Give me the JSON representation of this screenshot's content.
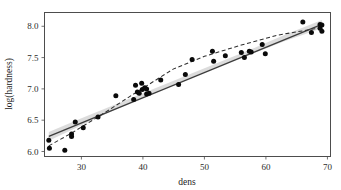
{
  "chart_data": {
    "type": "scatter",
    "title": "",
    "subtitle": "",
    "xlabel": "dens",
    "ylabel": "log(hardness)",
    "xlim": [
      24,
      70.5
    ],
    "ylim": [
      5.92,
      8.22
    ],
    "xticks": [
      30,
      40,
      50,
      60,
      70
    ],
    "xtick_labels": [
      "30",
      "40",
      "50",
      "60",
      "70"
    ],
    "yticks": [
      6.0,
      6.5,
      7.0,
      7.5,
      8.0
    ],
    "ytick_labels": [
      "6.0",
      "6.5",
      "7.0",
      "7.5",
      "8.0"
    ],
    "x_minor_ticks": [
      25,
      35,
      45,
      55,
      65
    ],
    "y_minor_ticks": [
      6.25,
      6.75,
      7.25,
      7.75
    ],
    "grid": true,
    "legend": "none",
    "point_color": "#0a0a0a",
    "line_color": "#3d3d3d",
    "band_color": "#bfbfbf",
    "panel_background": "#ffffff",
    "grid_color": "#d9d9d9",
    "points": [
      {
        "x": 24.7,
        "y": 6.18
      },
      {
        "x": 24.8,
        "y": 6.05
      },
      {
        "x": 27.3,
        "y": 6.02
      },
      {
        "x": 28.4,
        "y": 6.28
      },
      {
        "x": 28.4,
        "y": 6.24
      },
      {
        "x": 29.0,
        "y": 6.47
      },
      {
        "x": 30.3,
        "y": 6.38
      },
      {
        "x": 32.7,
        "y": 6.55
      },
      {
        "x": 35.6,
        "y": 6.89
      },
      {
        "x": 38.5,
        "y": 6.83
      },
      {
        "x": 38.8,
        "y": 7.06
      },
      {
        "x": 39.1,
        "y": 6.95
      },
      {
        "x": 39.4,
        "y": 6.93
      },
      {
        "x": 39.8,
        "y": 7.09
      },
      {
        "x": 39.9,
        "y": 6.99
      },
      {
        "x": 40.3,
        "y": 7.02
      },
      {
        "x": 40.6,
        "y": 7.0
      },
      {
        "x": 40.6,
        "y": 6.92
      },
      {
        "x": 41.0,
        "y": 6.93
      },
      {
        "x": 42.9,
        "y": 7.14
      },
      {
        "x": 45.8,
        "y": 7.07
      },
      {
        "x": 46.9,
        "y": 7.23
      },
      {
        "x": 48.0,
        "y": 7.47
      },
      {
        "x": 51.3,
        "y": 7.6
      },
      {
        "x": 51.5,
        "y": 7.44
      },
      {
        "x": 53.4,
        "y": 7.53
      },
      {
        "x": 56.0,
        "y": 7.58
      },
      {
        "x": 56.5,
        "y": 7.5
      },
      {
        "x": 57.3,
        "y": 7.6
      },
      {
        "x": 57.6,
        "y": 7.59
      },
      {
        "x": 59.4,
        "y": 7.71
      },
      {
        "x": 59.9,
        "y": 7.56
      },
      {
        "x": 66.0,
        "y": 8.07
      },
      {
        "x": 67.4,
        "y": 7.9
      },
      {
        "x": 68.8,
        "y": 7.97
      },
      {
        "x": 68.8,
        "y": 8.03
      },
      {
        "x": 69.1,
        "y": 8.02
      },
      {
        "x": 69.1,
        "y": 7.92
      }
    ],
    "series": [
      {
        "name": "linear-fit",
        "style": "solid",
        "x": [
          24.7,
          69.1
        ],
        "y": [
          6.24,
          8.03
        ]
      },
      {
        "name": "smoother-fit",
        "style": "dashed",
        "x": [
          24.7,
          28.5,
          33.0,
          39.0,
          45.0,
          50.0,
          56.0,
          62.0,
          69.1
        ],
        "y": [
          6.09,
          6.3,
          6.57,
          6.95,
          7.32,
          7.52,
          7.7,
          7.86,
          7.98
        ]
      }
    ],
    "confidence_band": {
      "name": "linear-fit-ci",
      "level": 0.95,
      "x": [
        24.7,
        30.0,
        36.0,
        42.0,
        47.0,
        52.0,
        58.0,
        63.0,
        69.1
      ],
      "upper": [
        6.31,
        6.53,
        6.77,
        7.01,
        7.21,
        7.41,
        7.65,
        7.86,
        8.1
      ],
      "lower": [
        6.17,
        6.42,
        6.69,
        6.95,
        7.15,
        7.35,
        7.57,
        7.76,
        7.97
      ]
    }
  }
}
